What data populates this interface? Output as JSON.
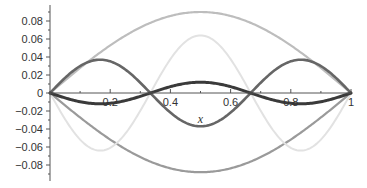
{
  "chart_data": {
    "type": "line",
    "title": "",
    "xlabel": "x",
    "ylabel": "",
    "xlim": [
      0,
      1
    ],
    "ylim": [
      -0.09,
      0.09
    ],
    "grid": false,
    "legend": null,
    "x_ticks": [
      0.2,
      0.4,
      0.6,
      0.8,
      1
    ],
    "x_tick_labels": [
      "0.2",
      "0.4",
      "0.6",
      "0.8",
      "1"
    ],
    "y_ticks": [
      0.08,
      0.06,
      0.04,
      0.02,
      0,
      -0.02,
      -0.04,
      -0.06,
      -0.08
    ],
    "y_tick_labels": [
      "0.08",
      "0.06",
      "0.04",
      "0.02",
      "0",
      "−0.02",
      "−0.04",
      "−0.06",
      "−0.08"
    ],
    "series": [
      {
        "name": "curve-1",
        "formula": "0.09*sin(pi*x)",
        "amplitude": 0.09,
        "mode": 1,
        "color": "#bdbdbd",
        "width": 2.2
      },
      {
        "name": "curve-2",
        "formula": "-0.088*sin(pi*x)",
        "amplitude": -0.088,
        "mode": 1,
        "color": "#9a9a9a",
        "width": 2.2
      },
      {
        "name": "curve-3",
        "formula": "-0.064*sin(3*pi*x)",
        "amplitude": -0.064,
        "mode": 3,
        "color": "#e2e2e2",
        "width": 2.0
      },
      {
        "name": "curve-4",
        "formula": "0.037*sin(3*pi*x)",
        "amplitude": 0.037,
        "mode": 3,
        "color": "#666666",
        "width": 2.6
      },
      {
        "name": "curve-5",
        "formula": "-0.012*sin(3*pi*x)",
        "amplitude": -0.012,
        "mode": 3,
        "color": "#3a3a3a",
        "width": 3.0
      }
    ],
    "sample_points": {
      "x": [
        0,
        0.1667,
        0.3333,
        0.5,
        0.6667,
        0.8333,
        1
      ],
      "curve-1": [
        0,
        0.045,
        0.078,
        0.09,
        0.078,
        0.045,
        0
      ],
      "curve-2": [
        0,
        -0.044,
        -0.076,
        -0.088,
        -0.076,
        -0.044,
        0
      ],
      "curve-3": [
        0,
        -0.064,
        0,
        0.064,
        0,
        -0.064,
        0
      ],
      "curve-4": [
        0,
        0.037,
        0,
        -0.037,
        0,
        0.037,
        0
      ],
      "curve-5": [
        0,
        -0.012,
        0,
        0.012,
        0,
        -0.012,
        0
      ]
    }
  },
  "layout": {
    "x0_px": 50,
    "x1_px": 351,
    "y0_px": 93,
    "px_per_unit_y": 900,
    "axis_color": "#555555"
  }
}
